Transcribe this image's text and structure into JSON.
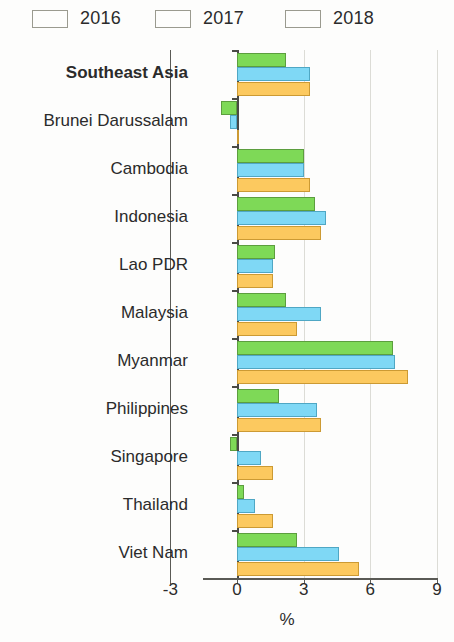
{
  "legend": {
    "items": [
      {
        "label": "2016",
        "color": "#7ed957",
        "key": "y2016"
      },
      {
        "label": "2017",
        "color": "#7fd8f5",
        "key": "y2017"
      },
      {
        "label": "2018",
        "color": "#fcc95f",
        "key": "y2018"
      }
    ]
  },
  "axis": {
    "tick_labels": [
      "-3",
      "0",
      "3",
      "6",
      "9"
    ],
    "title": "%"
  },
  "chart_data": {
    "type": "bar",
    "orientation": "horizontal",
    "title": "",
    "subtitle": "",
    "xlabel": "%",
    "ylabel": "",
    "xlim": [
      -3,
      9
    ],
    "xticks": [
      -3,
      0,
      3,
      6,
      9
    ],
    "grid": true,
    "legend_position": "top-left",
    "categories": [
      "Southeast Asia",
      "Brunei Darussalam",
      "Cambodia",
      "Indonesia",
      "Lao PDR",
      "Malaysia",
      "Myanmar",
      "Philippines",
      "Singapore",
      "Thailand",
      "Viet Nam"
    ],
    "highlighted_categories": [
      "Southeast Asia"
    ],
    "series": [
      {
        "name": "2016",
        "color": "#7ed957",
        "values": [
          2.2,
          -0.7,
          3.0,
          3.5,
          1.7,
          2.2,
          7.0,
          1.9,
          -0.3,
          0.3,
          2.7
        ]
      },
      {
        "name": "2017",
        "color": "#7fd8f5",
        "values": [
          3.3,
          -0.3,
          3.0,
          4.0,
          1.6,
          3.8,
          7.1,
          3.6,
          1.1,
          0.8,
          4.6
        ]
      },
      {
        "name": "2018",
        "color": "#fcc95f",
        "values": [
          3.3,
          0.1,
          3.3,
          3.8,
          1.6,
          2.7,
          7.7,
          3.8,
          1.6,
          1.6,
          5.5
        ]
      }
    ]
  }
}
